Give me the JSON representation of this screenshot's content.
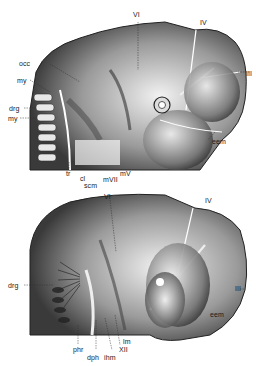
{
  "figure": {
    "type": "anatomical-illustration",
    "panels": [
      {
        "id": "upper",
        "labels": {
          "VI": "VI",
          "IV": "IV",
          "III": "III",
          "occ": "occ",
          "my": "my",
          "drg": "drg",
          "my2": "my",
          "eem": "eem",
          "tr": "tr",
          "cl": "cl",
          "scm": "scm",
          "mVII": "mVII",
          "mV": "mV"
        }
      },
      {
        "id": "lower",
        "labels": {
          "VI": "VI",
          "IV": "IV",
          "III": "III",
          "drg": "drg",
          "eem": "eem",
          "phr": "phr",
          "dph": "dph",
          "ihm": "ihm",
          "XII": "XII",
          "lm": "lm"
        }
      }
    ]
  }
}
